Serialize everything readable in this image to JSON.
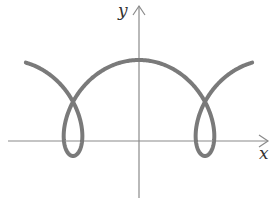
{
  "chart_data": {
    "type": "line",
    "title": "",
    "xlabel": "x",
    "ylabel": "y",
    "grid": false,
    "legend": null,
    "parametric": {
      "x": "r*t + d*sin(t)",
      "y": "h - d2*cos(t)",
      "t_range": [
        -5.95,
        5.95
      ],
      "pixel_params": {
        "x0": 139,
        "r": 21,
        "d": 36,
        "h": 108,
        "d2": 48
      }
    },
    "features": {
      "maximum": {
        "x": 0,
        "y": "top",
        "on_axis": "y"
      },
      "loops": [
        {
          "center_x_relative": "left",
          "crosses_x_axis": true
        },
        {
          "center_x_relative": "right",
          "crosses_x_axis": true
        }
      ]
    },
    "series": [
      {
        "name": "curve",
        "color": "#7a7a7a",
        "stroke_width": 4
      }
    ],
    "axes": {
      "color": "#8a8a8a",
      "x_axis_arrow": true,
      "y_axis_arrow": true
    }
  },
  "labels": {
    "x": "x",
    "y": "y"
  }
}
